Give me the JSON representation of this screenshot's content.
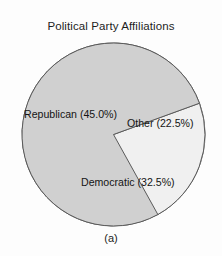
{
  "chart_data": {
    "type": "pie",
    "title": "Political Party Affiliations",
    "caption": "(a)",
    "categories": [
      "Republican",
      "Democratic",
      "Other"
    ],
    "values": [
      45.0,
      32.5,
      22.5
    ],
    "unit": "%",
    "labels": [
      "Republican (45.0%)",
      "Democratic (32.5%)",
      "Other (22.5%)"
    ],
    "slices": [
      {
        "name": "Republican",
        "value": 45.0,
        "label": "Republican (45.0%)",
        "color": "#e3e3e3",
        "start_angle_deg": 137.0,
        "end_angle_deg": 299.0
      },
      {
        "name": "Democratic",
        "value": 32.5,
        "label": "Democratic (32.5%)",
        "color": "#f0f0f0",
        "start_angle_deg": 20.0,
        "end_angle_deg": 137.0
      },
      {
        "name": "Other",
        "value": 22.5,
        "label": "Other (22.5%)",
        "color": "#d0d0d0",
        "start_angle_deg": 299.0,
        "end_angle_deg": 380.0
      }
    ],
    "legend": "none",
    "grid": false,
    "xlabel": "",
    "ylabel": "",
    "edge_color": "#5a5a5a",
    "background_color": "#fdfdfd"
  }
}
